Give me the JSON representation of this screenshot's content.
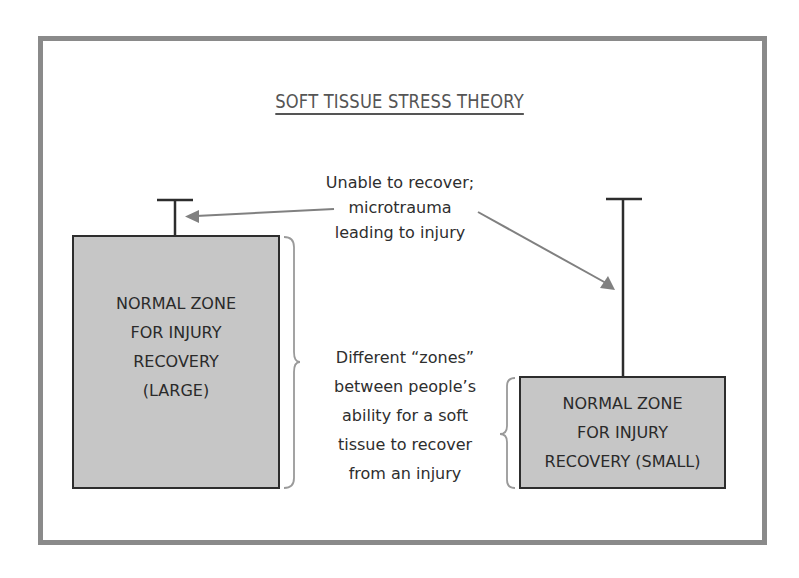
{
  "diagram": {
    "title": "SOFT TISSUE STRESS THEORY",
    "annotation_top": {
      "lines": [
        "Unable to recover;",
        "microtrauma",
        "leading to injury"
      ]
    },
    "annotation_zones": {
      "lines": [
        "Different “zones”",
        "between people’s",
        "ability for a soft",
        "tissue to recover",
        "from an injury"
      ]
    },
    "zone_large": {
      "lines": [
        "NORMAL ZONE",
        "FOR INJURY",
        "RECOVERY",
        "(LARGE)"
      ]
    },
    "zone_small": {
      "lines": [
        "NORMAL ZONE",
        "FOR INJURY",
        "RECOVERY (SMALL)"
      ]
    },
    "colors": {
      "frame": "#8a8a8a",
      "box_fill": "#c6c6c6",
      "box_border": "#2d2d2d",
      "arrow": "#808080",
      "brace": "#9a9a9a",
      "title": "#555555",
      "text": "#2e2e2e"
    }
  }
}
